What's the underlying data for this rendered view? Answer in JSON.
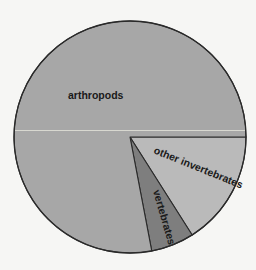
{
  "chart_data": {
    "type": "pie",
    "title": "",
    "categories": [
      "arthropods",
      "other invertebrates",
      "vertebrates"
    ],
    "values": [
      78,
      16,
      6
    ],
    "unit": "percent (estimated from slice angles)",
    "colors": {
      "arthropods": "#a7a7a7",
      "other invertebrates": "#bababa",
      "vertebrates": "#7e7e7e"
    },
    "start_angle_deg": 0,
    "direction": "clockwise",
    "legend": "none (labels inside slices)"
  },
  "labels": {
    "arthropods": "arthropods",
    "other_invertebrates": "other invertebrates",
    "vertebrates": "vertebrates"
  },
  "style": {
    "background": "#f6f6f4",
    "outline": "#2a2a2a",
    "artifact_line": "#d8d8d0"
  }
}
